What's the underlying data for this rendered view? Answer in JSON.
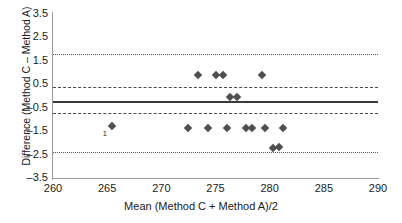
{
  "chart_data": {
    "type": "scatter",
    "title": "",
    "xlabel": "Mean (Method C + Method A)/2",
    "ylabel": "Difference (Method C – Method A)",
    "xlim": [
      260,
      290
    ],
    "ylim": [
      -3.5,
      3.5
    ],
    "xticks": [
      "260",
      "265",
      "270",
      "275",
      "280",
      "285",
      "290"
    ],
    "yticks": [
      "3.5",
      "2.5",
      "1.5",
      "0.5",
      "-0.5",
      "-1.5",
      "-2.5",
      "-3.5"
    ],
    "grid": false,
    "legend": "none",
    "points": [
      {
        "x": 265.4,
        "y": -1.28,
        "label": "1"
      },
      {
        "x": 272.5,
        "y": -1.35
      },
      {
        "x": 273.4,
        "y": 0.9
      },
      {
        "x": 274.3,
        "y": -1.35
      },
      {
        "x": 275.0,
        "y": 0.9
      },
      {
        "x": 275.7,
        "y": 0.9
      },
      {
        "x": 276.1,
        "y": -1.35
      },
      {
        "x": 276.3,
        "y": -0.05
      },
      {
        "x": 277.0,
        "y": -0.05
      },
      {
        "x": 277.8,
        "y": -1.38
      },
      {
        "x": 278.4,
        "y": -1.38
      },
      {
        "x": 279.3,
        "y": 0.9
      },
      {
        "x": 279.6,
        "y": -1.38
      },
      {
        "x": 280.3,
        "y": -2.22
      },
      {
        "x": 280.9,
        "y": -2.18
      },
      {
        "x": 281.2,
        "y": -1.38
      }
    ],
    "reference_lines": [
      {
        "name": "upper-limit-of-agreement",
        "value": 1.78,
        "style": "dotted"
      },
      {
        "name": "upper-dashed-line",
        "value": 0.37,
        "style": "dashed"
      },
      {
        "name": "mean-bias-line",
        "value": -0.2,
        "style": "solid"
      },
      {
        "name": "lower-dashed-line",
        "value": -0.72,
        "style": "dashed"
      },
      {
        "name": "lower-limit-of-agreement",
        "value": -2.39,
        "style": "dotted"
      }
    ],
    "annotations": [
      {
        "text": "1",
        "x": 264.6,
        "y": -1.45
      }
    ]
  }
}
